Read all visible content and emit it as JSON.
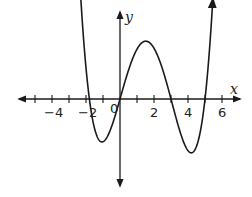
{
  "chart_data": {
    "type": "line",
    "title": "",
    "xlabel": "x",
    "ylabel": "y",
    "xlim": [
      -5.8,
      6.9
    ],
    "grid": false,
    "x_ticks": [
      -5,
      -4,
      -3,
      -2,
      -1,
      1,
      2,
      3,
      4,
      5,
      6
    ],
    "x_tick_labels": [
      {
        "value": -4,
        "label": "−4"
      },
      {
        "value": -2,
        "label": "−2"
      },
      {
        "value": 0,
        "label": "0"
      },
      {
        "value": 2,
        "label": "2"
      },
      {
        "value": 4,
        "label": "4"
      },
      {
        "value": 6,
        "label": "6"
      }
    ],
    "series": [
      {
        "name": "f(x)",
        "description": "Quartic polynomial with roots near -1.8, 0, 3, 5; local minima near x=-1 and x=4.2; local maximum near x=1.5",
        "roots": [
          -1.8,
          0,
          3,
          5
        ],
        "x": [
          -2.4,
          -2,
          -1.5,
          -1,
          -0.5,
          0,
          0.5,
          1,
          1.5,
          2,
          2.5,
          3,
          3.5,
          4,
          4.25,
          4.5,
          5,
          5.4
        ],
        "y_relative": [
          1.0,
          0.25,
          -0.55,
          -0.85,
          -0.55,
          0,
          0.55,
          0.9,
          1.0,
          0.85,
          0.45,
          0,
          -0.6,
          -0.9,
          -0.92,
          -0.85,
          0,
          1.0
        ]
      }
    ],
    "annotations": [
      "Arrows at both ends of the curve pointing up",
      "Axes drawn with arrows at both ends"
    ]
  },
  "labels": {
    "x_axis": "x",
    "y_axis": "y",
    "origin": "0",
    "ticks": [
      "−4",
      "−2",
      "2",
      "4",
      "6"
    ]
  },
  "colors": {
    "stroke": "#1a1a1a",
    "background": "#ffffff"
  }
}
